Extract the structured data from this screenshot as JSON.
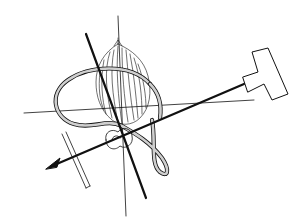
{
  "diagram": {
    "title": "",
    "background": "#ffffff",
    "stroke": "#111111",
    "elements": {
      "flame_bundle": "fibrous-bundle",
      "loop": "double-outlined tube loop",
      "axes": [
        "vertical thin axis",
        "steep thick axis",
        "horizontal thin axis",
        "arrow axis"
      ],
      "connector": "T-shaped block",
      "rod": "slanted double-line rod"
    }
  }
}
